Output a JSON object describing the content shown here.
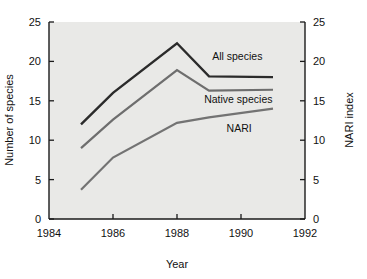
{
  "chart_data": {
    "type": "line",
    "title": "",
    "xlabel": "Year",
    "ylabel": "Number of species",
    "y2label": "NARI index",
    "xlim": [
      1984,
      1992
    ],
    "ylim": [
      0,
      25
    ],
    "y2lim": [
      0,
      25
    ],
    "grid": false,
    "legend_position": "inline-right",
    "x_ticks": [
      "1984",
      "1986",
      "1988",
      "1990",
      "1992"
    ],
    "x_tick_values": [
      1984,
      1986,
      1988,
      1990,
      1992
    ],
    "y_ticks": [
      "0",
      "5",
      "10",
      "15",
      "20",
      "25"
    ],
    "y_tick_values": [
      0,
      5,
      10,
      15,
      20,
      25
    ],
    "y2_ticks": [
      "0",
      "5",
      "10",
      "15",
      "20",
      "25"
    ],
    "y2_tick_values": [
      0,
      5,
      10,
      15,
      20,
      25
    ],
    "x": [
      1985,
      1986,
      1988,
      1989,
      1991
    ],
    "series": [
      {
        "name": "All species",
        "values": [
          12.0,
          16.0,
          22.3,
          18.1,
          18.0
        ],
        "color": "#2b2b2b",
        "width": 2.4,
        "label_x": 1989.1,
        "label_y": 20.2
      },
      {
        "name": "Native species",
        "values": [
          9.0,
          12.6,
          18.9,
          16.3,
          16.4
        ],
        "color": "#6e6e6e",
        "width": 2.2,
        "label_x": 1988.85,
        "label_y": 14.7
      },
      {
        "name": "NARI",
        "values": [
          3.7,
          7.8,
          12.2,
          12.9,
          14.0
        ],
        "color": "#737373",
        "width": 2.2,
        "label_x": 1989.55,
        "label_y": 11.0
      }
    ],
    "plot_background": "#e9e9e7",
    "page_background": "#ffffff"
  }
}
